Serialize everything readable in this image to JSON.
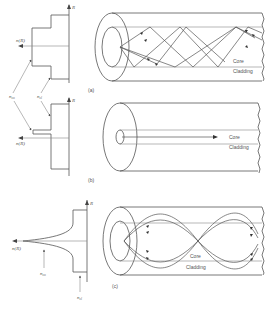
{
  "figure": {
    "panels": [
      {
        "id": "a",
        "caption": "(a)",
        "profile": "step-index multimode",
        "axis_label": "R",
        "index_label": "n(R)",
        "labels": {
          "core": "Core",
          "cladding": "Cladding"
        }
      },
      {
        "id": "b",
        "caption": "(b)",
        "profile": "step-index single-mode",
        "axis_label": "R",
        "index_label": "n(R)",
        "labels": {
          "core": "Core",
          "cladding": "Cladding"
        }
      },
      {
        "id": "c",
        "caption": "(c)",
        "profile": "graded-index multimode",
        "axis_label": "R",
        "index_label": "n(R)",
        "labels": {
          "core": "Core",
          "cladding": "Cladding"
        },
        "pointer_labels": {
          "core_index": "n_co",
          "cladding_index": "n_cl"
        }
      }
    ],
    "shared_pointer_labels": {
      "core_index": "n_co",
      "cladding_index": "n_cl"
    }
  }
}
